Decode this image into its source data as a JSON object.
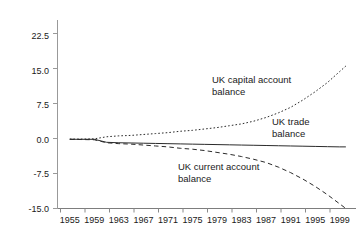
{
  "chart_data": {
    "type": "line",
    "title": "",
    "xlabel": "",
    "ylabel": "",
    "xlim": [
      1953,
      2001
    ],
    "ylim": [
      -15.0,
      26.0
    ],
    "grid": false,
    "legend_position": "inline-annotations",
    "yticks": [
      "22.5",
      "15.0",
      "7.5",
      "0.0",
      "-7.5",
      "-15.0"
    ],
    "ytick_values": [
      22.5,
      15.0,
      7.5,
      0.0,
      -7.5,
      -15.0
    ],
    "xticks": [
      "1955",
      "1959",
      "1963",
      "1967",
      "1971",
      "1975",
      "1979",
      "1983",
      "1987",
      "1991",
      "1995",
      "1999"
    ],
    "xtick_values": [
      1955,
      1959,
      1963,
      1967,
      1971,
      1975,
      1979,
      1983,
      1987,
      1991,
      1995,
      1999
    ],
    "x": [
      1955,
      1957,
      1959,
      1961,
      1963,
      1965,
      1967,
      1969,
      1971,
      1973,
      1975,
      1977,
      1979,
      1981,
      1983,
      1985,
      1987,
      1989,
      1991,
      1993,
      1995,
      1997,
      1999,
      2000
    ],
    "series": [
      {
        "name": "UK capital account balance",
        "style": "dotted",
        "color": "#2b2b2b",
        "values": [
          0.1,
          0.1,
          0.15,
          0.6,
          0.8,
          0.9,
          1.1,
          1.3,
          1.5,
          1.8,
          2.0,
          2.3,
          2.6,
          3.0,
          3.4,
          4.0,
          4.8,
          5.8,
          7.0,
          8.6,
          10.4,
          12.4,
          14.8,
          16.0
        ]
      },
      {
        "name": "UK trade balance",
        "style": "solid",
        "color": "#2b2b2b",
        "values": [
          0.05,
          0.05,
          0.05,
          -0.6,
          -0.7,
          -0.75,
          -0.8,
          -0.85,
          -0.9,
          -0.95,
          -1.0,
          -1.05,
          -1.1,
          -1.15,
          -1.2,
          -1.25,
          -1.3,
          -1.35,
          -1.4,
          -1.45,
          -1.5,
          -1.55,
          -1.6,
          -1.6
        ]
      },
      {
        "name": "UK current account balance",
        "style": "dashed",
        "color": "#2b2b2b",
        "values": [
          0.05,
          0.0,
          -0.05,
          -0.7,
          -0.9,
          -1.0,
          -1.2,
          -1.4,
          -1.6,
          -1.9,
          -2.1,
          -2.4,
          -2.8,
          -3.2,
          -3.7,
          -4.3,
          -5.0,
          -6.0,
          -7.2,
          -8.6,
          -10.2,
          -12.0,
          -14.0,
          -15.0
        ]
      }
    ],
    "annotations": [
      {
        "id": "capital-account",
        "text": "UK capital account\nbalance",
        "x_px": 212,
        "y_px": 74
      },
      {
        "id": "trade-balance",
        "text": "UK trade\nbalance",
        "x_px": 272,
        "y_px": 116
      },
      {
        "id": "current-account",
        "text": "UK current account\nbalance",
        "x_px": 178,
        "y_px": 161
      }
    ]
  },
  "axes": {
    "y_tick_labels": [
      "22.5",
      "15.0",
      "7.5",
      "0.0",
      "-7.5",
      "-15.0"
    ],
    "x_tick_labels": [
      "1955",
      "1959",
      "1963",
      "1967",
      "1971",
      "1975",
      "1979",
      "1983",
      "1987",
      "1991",
      "1995",
      "1999"
    ]
  },
  "annotations": {
    "capital": "UK capital account\nbalance",
    "trade": "UK trade\nbalance",
    "current": "UK current account\nbalance"
  },
  "colors": {
    "background": "#ffffff",
    "axis": "#888888",
    "line": "#2b2b2b",
    "text": "#1a1a1a"
  }
}
